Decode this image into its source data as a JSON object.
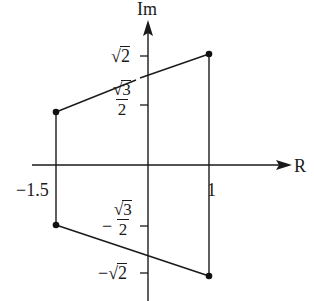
{
  "diagram": {
    "axes": {
      "x_label": "R",
      "y_label": "Im"
    },
    "x_ticks": [
      {
        "label": "−1.5",
        "value": -1.5
      },
      {
        "label": "1",
        "value": 1
      }
    ],
    "y_ticks": [
      {
        "label_radical": "√",
        "label_radicand": "2",
        "sign": "",
        "value": 1.414
      },
      {
        "label_num_radical": "√",
        "label_num_radicand": "3",
        "label_den": "2",
        "sign": "",
        "value": 0.866
      },
      {
        "label_num_radical": "√",
        "label_num_radicand": "3",
        "label_den": "2",
        "sign": "−",
        "value": -0.866
      },
      {
        "label_radical": "√",
        "label_radicand": "2",
        "sign": "−",
        "value": -1.414
      }
    ],
    "points": [
      {
        "x": -1.5,
        "y": 0.866
      },
      {
        "x": 1,
        "y": 1.414
      },
      {
        "x": 1,
        "y": -1.414
      },
      {
        "x": -1.5,
        "y": -0.866
      }
    ],
    "shape": "trapezoid"
  }
}
